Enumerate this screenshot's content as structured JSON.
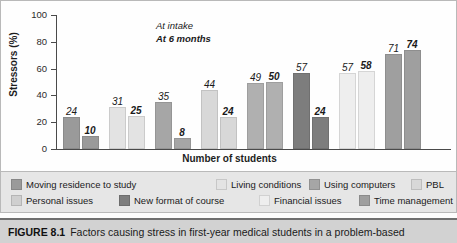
{
  "figure": {
    "number_label": "FIGURE 8.1",
    "caption_text": "Factors causing stress in first-year medical students in a problem-based"
  },
  "annotation": {
    "line1": "At intake",
    "line2": "At 6 months"
  },
  "chart_data": {
    "type": "bar",
    "title": "",
    "xlabel": "Number of students",
    "ylabel": "Stressors (%)",
    "ylim": [
      0,
      100
    ],
    "yticks": [
      0,
      20,
      40,
      60,
      80,
      100
    ],
    "ytick_labels": [
      "0",
      "20",
      "40",
      "60",
      "80",
      "100"
    ],
    "grid": false,
    "legend_position": "bottom",
    "categories": [
      "Moving residence to study",
      "Living conditions",
      "Using computers",
      "PBL",
      "Personal issues",
      "New format of course",
      "Financial issues",
      "Time management"
    ],
    "series": [
      {
        "name": "At intake",
        "values": [
          24,
          31,
          35,
          44,
          49,
          57,
          57,
          71
        ]
      },
      {
        "name": "At 6 months",
        "values": [
          10,
          25,
          8,
          24,
          50,
          24,
          58,
          74
        ]
      }
    ],
    "category_colors": [
      "#9a9a9a",
      "#e3e3e3",
      "#a6a6a6",
      "#d8d8d8",
      "#b0b0b0",
      "#7d7d7d",
      "#eeeeee",
      "#9f9f9f"
    ]
  },
  "legend": {
    "items": [
      {
        "label": "Moving residence to study",
        "color": "#9a9a9a"
      },
      {
        "label": "Living conditions",
        "color": "#e3e3e3"
      },
      {
        "label": "Using computers",
        "color": "#a6a6a6"
      },
      {
        "label": "PBL",
        "color": "#d8d8d8"
      },
      {
        "label": "Personal issues",
        "color": "#cfcfcf"
      },
      {
        "label": "New format of course",
        "color": "#7d7d7d"
      },
      {
        "label": "Financial issues",
        "color": "#eeeeee"
      },
      {
        "label": "Time management",
        "color": "#9f9f9f"
      }
    ]
  }
}
